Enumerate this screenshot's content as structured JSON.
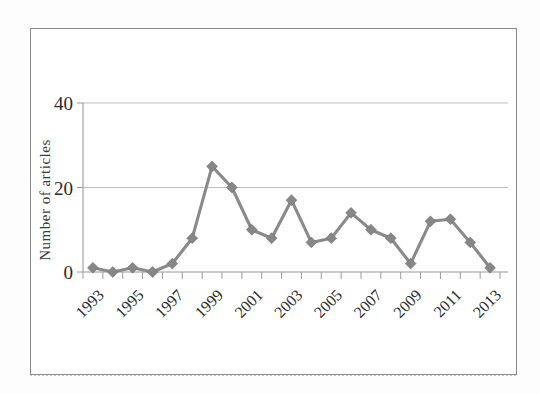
{
  "figure": {
    "caption": "",
    "frame_border_color": "#8a8a8a"
  },
  "axis": {
    "ylabel": "Number of articles",
    "ytick_labels": [
      "0",
      "20",
      "40"
    ],
    "xtick_labels": [
      "1993",
      "1995",
      "1997",
      "1999",
      "2001",
      "2003",
      "2005",
      "2007",
      "2009",
      "2011",
      "2013"
    ]
  },
  "chart_data": {
    "type": "line",
    "title": "",
    "xlabel": "",
    "ylabel": "Number of articles",
    "series_name": "Number of articles",
    "marker": "diamond",
    "series_color": "#878787",
    "grid": "horizontal",
    "legend": "none",
    "ylim": [
      0,
      42
    ],
    "yticks": [
      0,
      20,
      40
    ],
    "xlim": [
      1993,
      2014
    ],
    "xtick_years": [
      1993,
      1995,
      1997,
      1999,
      2001,
      2003,
      2005,
      2007,
      2009,
      2011,
      2013
    ],
    "x": [
      1993,
      1994,
      1995,
      1996,
      1997,
      1998,
      1999,
      2000,
      2001,
      2002,
      2003,
      2004,
      2005,
      2006,
      2007,
      2008,
      2009,
      2010,
      2011,
      2012,
      2013
    ],
    "values": [
      1,
      0,
      1,
      0,
      2,
      8,
      25,
      20,
      10,
      8,
      17,
      7,
      8,
      14,
      10,
      8,
      2,
      12,
      12.5,
      7,
      1
    ],
    "categories": [
      "1993",
      "1994",
      "1995",
      "1996",
      "1997",
      "1998",
      "1999",
      "2000",
      "2001",
      "2002",
      "2003",
      "2004",
      "2005",
      "2006",
      "2007",
      "2008",
      "2009",
      "2010",
      "2011",
      "2012",
      "2013"
    ]
  }
}
